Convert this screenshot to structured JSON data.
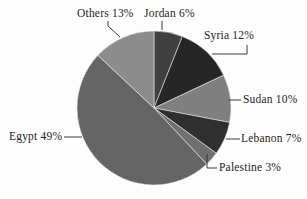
{
  "chart_data": {
    "type": "pie",
    "title": "",
    "unit": "%",
    "direction": "clockwise",
    "start_angle_deg": 0,
    "legend": "none",
    "labels_style": "outside-with-leader-lines",
    "slices": [
      {
        "label": "Jordan",
        "value": 6,
        "display": "Jordan 6%",
        "color": "#404040"
      },
      {
        "label": "Syria",
        "value": 12,
        "display": "Syria 12%",
        "color": "#262626"
      },
      {
        "label": "Sudan",
        "value": 10,
        "display": "Sudan 10%",
        "color": "#7f7f7f"
      },
      {
        "label": "Lebanon",
        "value": 7,
        "display": "Lebanon 7%",
        "color": "#2f2f2f"
      },
      {
        "label": "Palestine",
        "value": 3,
        "display": "Palestine 3%",
        "color": "#6f6f6f"
      },
      {
        "label": "Egypt",
        "value": 49,
        "display": "Egypt 49%",
        "color": "#656565"
      },
      {
        "label": "Others",
        "value": 13,
        "display": "Others 13%",
        "color": "#8c8c8c"
      }
    ]
  }
}
